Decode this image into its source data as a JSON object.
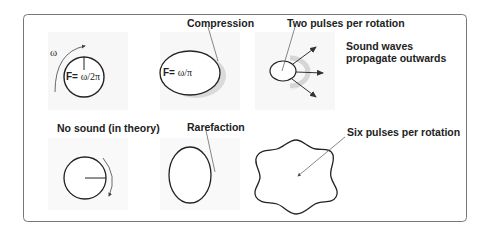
{
  "diagram": {
    "labels": {
      "compression": "Compression",
      "two_pulses": "Two pulses per rotation",
      "sound_waves_line1": "Sound waves",
      "sound_waves_line2": "propagate outwards",
      "no_sound": "No sound (in theory)",
      "rarefaction": "Rarefaction",
      "six_pulses": "Six pulses per rotation"
    },
    "formulas": {
      "f1_prefix": "F=",
      "f1_value": "ω/2π",
      "f2_prefix": "F=",
      "f2_value": "ω/π"
    },
    "omega_symbol": "ω",
    "colors": {
      "stroke": "#222222",
      "frame": "#777777",
      "shadow": "#cfcfcf",
      "panel_bg": "#f7f7f7"
    }
  }
}
